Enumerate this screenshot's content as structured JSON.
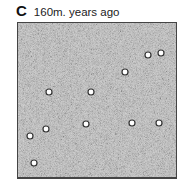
{
  "panel": {
    "letter": "C",
    "caption": "160m. years ago",
    "background_color": "#c8c8c8",
    "point_fill": "#ffffff",
    "point_stroke": "#333333",
    "points": [
      {
        "x": 147,
        "y": 54
      },
      {
        "x": 160,
        "y": 52
      },
      {
        "x": 124,
        "y": 71
      },
      {
        "x": 48,
        "y": 91
      },
      {
        "x": 90,
        "y": 91
      },
      {
        "x": 85,
        "y": 123
      },
      {
        "x": 131,
        "y": 122
      },
      {
        "x": 158,
        "y": 122
      },
      {
        "x": 45,
        "y": 128
      },
      {
        "x": 29,
        "y": 135
      },
      {
        "x": 33,
        "y": 162
      }
    ]
  }
}
